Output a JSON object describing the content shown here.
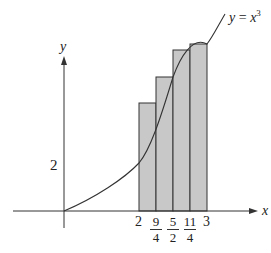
{
  "diagram": {
    "type": "riemann-sum-right-endpoints",
    "curve_label": "y = x³",
    "curve_label_parts": {
      "lhs": "y",
      "eq": " = ",
      "base": "x",
      "exp": "3"
    },
    "axes": {
      "x_label": "x",
      "y_label": "y"
    },
    "y_tick": {
      "label": "2"
    },
    "x_ticks": [
      {
        "label": "2"
      },
      {
        "num": "9",
        "den": "4"
      },
      {
        "num": "5",
        "den": "2"
      },
      {
        "num": "11",
        "den": "4"
      },
      {
        "label": "3"
      }
    ],
    "rectangles": [
      {
        "x_left": "2",
        "x_right": "9/4",
        "height": "(9/4)^3"
      },
      {
        "x_left": "9/4",
        "x_right": "5/2",
        "height": "(5/2)^3"
      },
      {
        "x_left": "5/2",
        "x_right": "11/4",
        "height": "(11/4)^3"
      },
      {
        "x_left": "11/4",
        "x_right": "3",
        "height": "3^3"
      }
    ],
    "colors": {
      "fill": "#c8c8c8",
      "stroke": "#333333",
      "axis": "#333333"
    }
  }
}
